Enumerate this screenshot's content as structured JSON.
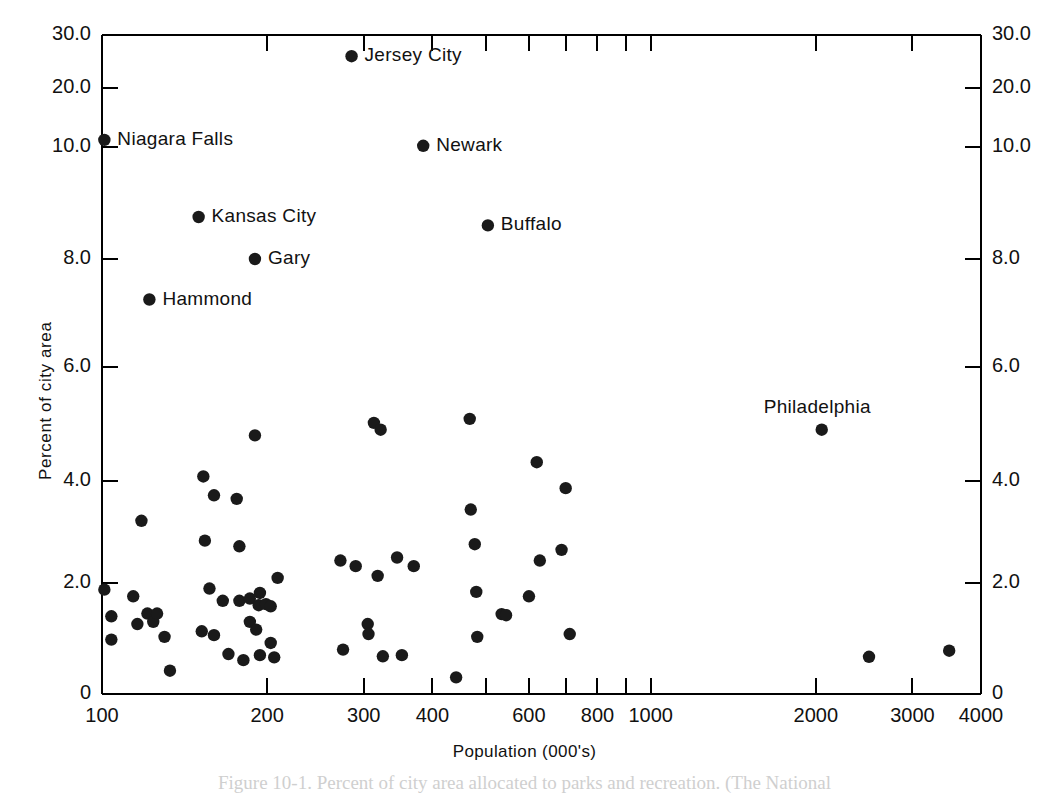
{
  "figure": {
    "caption_fragment": "Figure 10-1. Percent of city area allocated to parks and recreation. (The National"
  },
  "axes": {
    "y_title": "Percent of city area",
    "x_title": "Population  (000's)",
    "y_tick_labels": [
      "30.0",
      "20.0",
      "10.0",
      "8.0",
      "6.0",
      "4.0",
      "2.0",
      "0"
    ],
    "y_tick_values": [
      30.0,
      20.0,
      10.0,
      8.0,
      6.0,
      4.0,
      2.0,
      0
    ],
    "x_tick_labels": [
      "100",
      "200",
      "300",
      "400",
      "600",
      "800",
      "1000",
      "2000",
      "3000",
      "4000"
    ],
    "x_tick_values": [
      100,
      200,
      300,
      400,
      600,
      800,
      1000,
      2000,
      3000,
      4000
    ],
    "x_minor_values": [
      500,
      700,
      900
    ],
    "x_scale": "log",
    "y_scale": "piecewise",
    "frame_color": "#000000"
  },
  "chart_data": {
    "type": "scatter",
    "title": "",
    "xlabel": "Population  (000's)",
    "ylabel": "Percent of city area",
    "xlim": [
      100,
      4000
    ],
    "ylim": [
      0,
      30
    ],
    "grid": false,
    "legend": "none",
    "marker_color": "#1a1a1a",
    "labeled_points": [
      {
        "name": "Jersey City",
        "x": 285,
        "y": 26.0,
        "label_side": "right"
      },
      {
        "name": "Niagara Falls",
        "x": 101,
        "y": 11.2,
        "label_side": "right"
      },
      {
        "name": "Newark",
        "x": 385,
        "y": 10.2,
        "label_side": "right"
      },
      {
        "name": "Kansas City",
        "x": 150,
        "y": 8.75,
        "label_side": "right"
      },
      {
        "name": "Buffalo",
        "x": 505,
        "y": 8.6,
        "label_side": "right"
      },
      {
        "name": "Gary",
        "x": 190,
        "y": 8.0,
        "label_side": "right"
      },
      {
        "name": "Hammond",
        "x": 122,
        "y": 7.25,
        "label_side": "right"
      },
      {
        "name": "Philadelphia",
        "x": 2050,
        "y": 4.9,
        "label_side": "above"
      }
    ],
    "unlabeled_points": [
      {
        "x": 118,
        "y": 3.22
      },
      {
        "x": 153,
        "y": 4.08
      },
      {
        "x": 160,
        "y": 3.72
      },
      {
        "x": 176,
        "y": 3.65
      },
      {
        "x": 154,
        "y": 2.83
      },
      {
        "x": 178,
        "y": 2.72
      },
      {
        "x": 101,
        "y": 1.88
      },
      {
        "x": 104,
        "y": 1.4
      },
      {
        "x": 104,
        "y": 0.98
      },
      {
        "x": 114,
        "y": 1.76
      },
      {
        "x": 116,
        "y": 1.26
      },
      {
        "x": 121,
        "y": 1.45
      },
      {
        "x": 124,
        "y": 1.3
      },
      {
        "x": 126,
        "y": 1.45
      },
      {
        "x": 130,
        "y": 1.03
      },
      {
        "x": 133,
        "y": 0.42
      },
      {
        "x": 152,
        "y": 1.13
      },
      {
        "x": 160,
        "y": 1.06
      },
      {
        "x": 157,
        "y": 1.9
      },
      {
        "x": 166,
        "y": 1.68
      },
      {
        "x": 170,
        "y": 0.72
      },
      {
        "x": 181,
        "y": 0.61
      },
      {
        "x": 178,
        "y": 1.68
      },
      {
        "x": 186,
        "y": 1.72
      },
      {
        "x": 186,
        "y": 1.3
      },
      {
        "x": 190,
        "y": 4.8
      },
      {
        "x": 191,
        "y": 1.16
      },
      {
        "x": 193,
        "y": 1.6
      },
      {
        "x": 194,
        "y": 1.82
      },
      {
        "x": 194,
        "y": 0.7
      },
      {
        "x": 199,
        "y": 1.62
      },
      {
        "x": 203,
        "y": 1.58
      },
      {
        "x": 203,
        "y": 0.92
      },
      {
        "x": 206,
        "y": 0.66
      },
      {
        "x": 209,
        "y": 2.1
      },
      {
        "x": 272,
        "y": 2.44
      },
      {
        "x": 275,
        "y": 0.8
      },
      {
        "x": 290,
        "y": 2.33
      },
      {
        "x": 305,
        "y": 1.26
      },
      {
        "x": 306,
        "y": 1.08
      },
      {
        "x": 313,
        "y": 5.02
      },
      {
        "x": 322,
        "y": 4.9
      },
      {
        "x": 318,
        "y": 2.14
      },
      {
        "x": 325,
        "y": 0.68
      },
      {
        "x": 345,
        "y": 2.5
      },
      {
        "x": 352,
        "y": 0.7
      },
      {
        "x": 370,
        "y": 2.33
      },
      {
        "x": 442,
        "y": 0.3
      },
      {
        "x": 468,
        "y": 5.09
      },
      {
        "x": 470,
        "y": 3.44
      },
      {
        "x": 478,
        "y": 2.76
      },
      {
        "x": 481,
        "y": 1.84
      },
      {
        "x": 483,
        "y": 1.03
      },
      {
        "x": 535,
        "y": 1.44
      },
      {
        "x": 545,
        "y": 1.42
      },
      {
        "x": 600,
        "y": 1.76
      },
      {
        "x": 620,
        "y": 4.33
      },
      {
        "x": 628,
        "y": 2.44
      },
      {
        "x": 688,
        "y": 2.65
      },
      {
        "x": 700,
        "y": 3.86
      },
      {
        "x": 712,
        "y": 1.08
      },
      {
        "x": 2500,
        "y": 0.67
      },
      {
        "x": 3500,
        "y": 0.78
      }
    ]
  }
}
